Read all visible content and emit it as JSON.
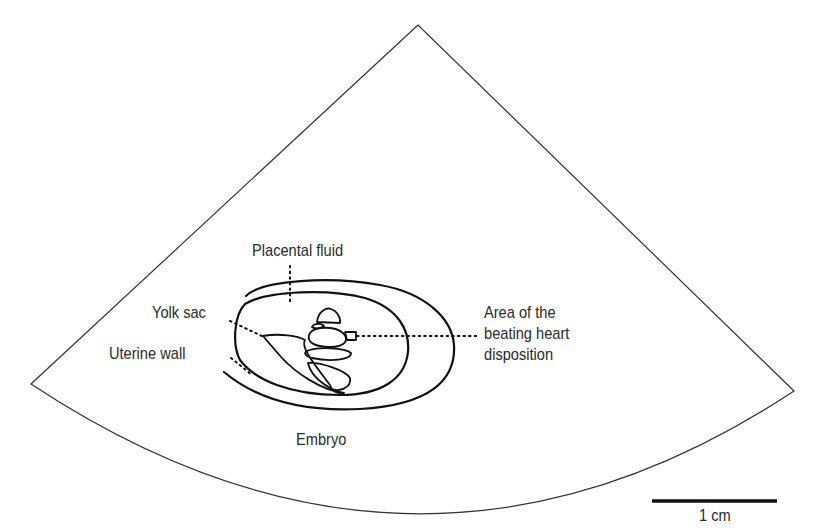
{
  "diagram": {
    "type": "ultrasound-sector-schematic",
    "colors": {
      "background": "#ffffff",
      "outline": "#222222",
      "text": "#2b2b2b"
    },
    "labels": {
      "placental_fluid": "Placental fluid",
      "yolk_sac": "Yolk sac",
      "uterine_wall": "Uterine wall",
      "heart_area": [
        "Area of the",
        "beating heart",
        "disposition"
      ],
      "embryo": "Embryo"
    },
    "scale_bar": {
      "label": "1 cm"
    }
  }
}
